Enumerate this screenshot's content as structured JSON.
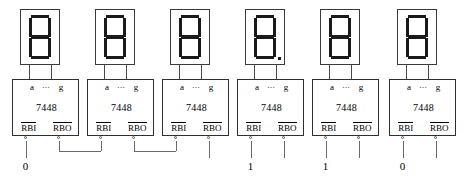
{
  "figure": {
    "title_artifact": "",
    "type": "logic-circuit-diagram",
    "colors": {
      "ink": "#000000",
      "box_stroke": "#2f2f2f",
      "display_stroke": "#3a3a3a",
      "segment_fill": "#1a1a1a",
      "wire": "#6a6a6a",
      "background": "#ffffff"
    }
  },
  "labels": {
    "pin_a": "a",
    "pin_dots": "⋯",
    "pin_g": "g",
    "part_number": "7448",
    "rbi": "RBI",
    "rbo": "RBO"
  },
  "units": [
    {
      "index": 1,
      "part_number": "7448",
      "display": {
        "segments_on": [
          "a",
          "b",
          "c",
          "d",
          "e",
          "f",
          "g"
        ],
        "decimal_point": false,
        "digit_shown": "8"
      },
      "rbi_input_label": "0",
      "rbi_source": "external-constant",
      "rbo_destination": "unit-2-rbi"
    },
    {
      "index": 2,
      "part_number": "7448",
      "display": {
        "segments_on": [
          "a",
          "b",
          "c",
          "d",
          "e",
          "f",
          "g"
        ],
        "decimal_point": false,
        "digit_shown": "8"
      },
      "rbi_input_label": "",
      "rbi_source": "unit-1-rbo",
      "rbo_destination": "unit-3-rbi"
    },
    {
      "index": 3,
      "part_number": "7448",
      "display": {
        "segments_on": [
          "a",
          "b",
          "c",
          "d",
          "e",
          "f",
          "g"
        ],
        "decimal_point": false,
        "digit_shown": "8"
      },
      "rbi_input_label": "",
      "rbi_source": "unit-2-rbo",
      "rbo_destination": "open"
    },
    {
      "index": 4,
      "part_number": "7448",
      "display": {
        "segments_on": [
          "a",
          "b",
          "c",
          "d",
          "e",
          "f",
          "g"
        ],
        "decimal_point": true,
        "digit_shown": "8."
      },
      "rbi_input_label": "1",
      "rbi_source": "external-constant",
      "rbo_destination": "open"
    },
    {
      "index": 5,
      "part_number": "7448",
      "display": {
        "segments_on": [
          "a",
          "b",
          "c",
          "d",
          "e",
          "f",
          "g"
        ],
        "decimal_point": false,
        "digit_shown": "8"
      },
      "rbi_input_label": "1",
      "rbi_source": "external-constant",
      "rbo_destination": "open"
    },
    {
      "index": 6,
      "part_number": "7448",
      "display": {
        "segments_on": [
          "a",
          "b",
          "c",
          "d",
          "e",
          "f",
          "g"
        ],
        "decimal_point": false,
        "digit_shown": "8"
      },
      "rbi_input_label": "0",
      "rbi_source": "external-constant",
      "rbo_destination": "open"
    }
  ]
}
